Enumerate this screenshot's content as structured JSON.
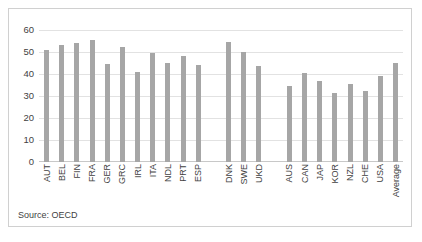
{
  "chart_data": {
    "type": "bar",
    "title": "",
    "xlabel": "",
    "ylabel": "",
    "ylim": [
      0,
      60
    ],
    "yticks": [
      0,
      10,
      20,
      30,
      40,
      50,
      60
    ],
    "grid": true,
    "legend": null,
    "bar_color": "#a6a6a6",
    "categories": [
      "AUT",
      "BEL",
      "FIN",
      "FRA",
      "GER",
      "GRC",
      "IRL",
      "ITA",
      "NDL",
      "PRT",
      "ESP",
      "",
      "DNK",
      "SWE",
      "UKD",
      "",
      "AUS",
      "CAN",
      "JAP",
      "KOR",
      "NZL",
      "CHE",
      "USA",
      "Average"
    ],
    "values": [
      51,
      53,
      54,
      55.5,
      44.5,
      52.5,
      41,
      49.5,
      45,
      48,
      44,
      null,
      54.5,
      50,
      43.5,
      null,
      34.5,
      40.5,
      37,
      31.5,
      35.5,
      32.5,
      39,
      45
    ],
    "source_note": "Source: OECD"
  }
}
